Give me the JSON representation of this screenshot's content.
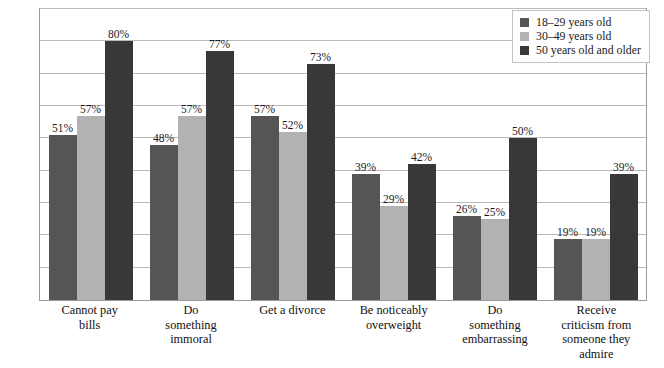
{
  "chart_data": {
    "type": "bar",
    "title": "",
    "xlabel": "",
    "ylabel_line1": "PERCENTAGE WHO WOULD FEEL BADLY",
    "ylabel_line2": "ABOUT THEMSELVES",
    "ylim": [
      0,
      90
    ],
    "grid": true,
    "grid_step": 10,
    "legend_position": "top-right",
    "categories": [
      "Cannot pay bills",
      "Do something immoral",
      "Get a divorce",
      "Be noticeably overweight",
      "Do something embarrassing",
      "Receive criticism from someone they admire"
    ],
    "category_lines": [
      [
        "Cannot pay",
        "bills"
      ],
      [
        "Do",
        "something",
        "immoral"
      ],
      [
        "Get a divorce"
      ],
      [
        "Be noticeably",
        "overweight"
      ],
      [
        "Do",
        "something",
        "embarrassing"
      ],
      [
        "Receive",
        "criticism from",
        "someone they",
        "admire"
      ]
    ],
    "series": [
      {
        "name": "18–29 years old",
        "color": "#555555",
        "values": [
          51,
          48,
          57,
          39,
          26,
          19
        ],
        "labels": [
          "51%",
          "48%",
          "57%",
          "39%",
          "26%",
          "19%"
        ]
      },
      {
        "name": "30–49 years old",
        "color": "#b2b2b2",
        "values": [
          57,
          57,
          52,
          29,
          25,
          19
        ],
        "labels": [
          "57%",
          "57%",
          "52%",
          "29%",
          "25%",
          "19%"
        ]
      },
      {
        "name": "50 years old and older",
        "color": "#383838",
        "values": [
          80,
          77,
          73,
          42,
          50,
          39
        ],
        "labels": [
          "80%",
          "77%",
          "73%",
          "42%",
          "50%",
          "39%"
        ]
      }
    ]
  },
  "legend": {
    "items": [
      {
        "label": "18–29 years old",
        "color": "#555555"
      },
      {
        "label": "30–49 years old",
        "color": "#b2b2b2"
      },
      {
        "label": "50 years old and older",
        "color": "#383838"
      }
    ]
  }
}
